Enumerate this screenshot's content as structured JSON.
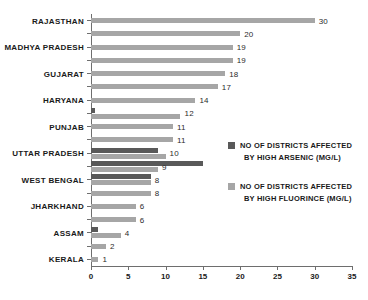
{
  "chart_data": {
    "type": "bar",
    "orientation": "horizontal",
    "title": "",
    "subtitle": "",
    "xlabel": "",
    "ylabel": "",
    "xlim": [
      0,
      35
    ],
    "xticks": [
      0,
      5,
      10,
      15,
      20,
      25,
      30,
      35
    ],
    "grid": false,
    "legend_position": "right",
    "colors": {
      "arsenic": "#595959",
      "fluoride": "#a6a6a6",
      "axis": "#6e6e6e",
      "text": "#1a1a1a",
      "background": "#ffffff"
    },
    "categories": [
      "RAJASTHAN",
      "",
      "MADHYA PRADESH",
      "",
      "GUJARAT",
      "",
      "HARYANA",
      "",
      "PUNJAB",
      "",
      "UTTAR PRADESH",
      "",
      "WEST BENGAL",
      "",
      "JHARKHAND",
      "",
      "ASSAM",
      "",
      "KERALA"
    ],
    "series": [
      {
        "name": "NO OF DISTRICTS AFFECTED BY HIGH FLUORINCE (MG/L)",
        "key": "fluoride",
        "color": "#a6a6a6",
        "values": [
          30,
          20,
          19,
          19,
          18,
          17,
          14,
          12,
          11,
          11,
          10,
          9,
          8,
          8,
          6,
          6,
          4,
          2,
          1
        ]
      },
      {
        "name": "NO OF DISTRICTS AFFECTED BY HIGH ARSENIC (MG/L)",
        "key": "arsenic",
        "color": "#595959",
        "values": [
          null,
          null,
          null,
          null,
          null,
          null,
          null,
          0.6,
          null,
          null,
          9,
          15,
          8,
          null,
          null,
          null,
          1,
          null,
          null
        ]
      }
    ],
    "data_labels": [
      30,
      20,
      19,
      19,
      18,
      17,
      14,
      12,
      11,
      11,
      10,
      9,
      8,
      8,
      6,
      6,
      4,
      2,
      1
    ]
  },
  "legend": {
    "entries": [
      {
        "swatch": "arsenic",
        "line1": "NO OF DISTRICTS AFFECTED",
        "line2": "BY HIGH ARSENIC (MG/L)"
      },
      {
        "swatch": "fluoride",
        "line1": "NO OF DISTRICTS AFFECTED",
        "line2": "BY HIGH FLUORINCE (MG/L)"
      }
    ]
  },
  "axis": {
    "x_tick_labels": [
      "0",
      "5",
      "10",
      "15",
      "20",
      "25",
      "30",
      "35"
    ]
  },
  "category_labels": [
    "RAJASTHAN",
    "MADHYA PRADESH",
    "GUJARAT",
    "HARYANA",
    "PUNJAB",
    "UTTAR PRADESH",
    "WEST BENGAL",
    "JHARKHAND",
    "ASSAM",
    "KERALA"
  ]
}
